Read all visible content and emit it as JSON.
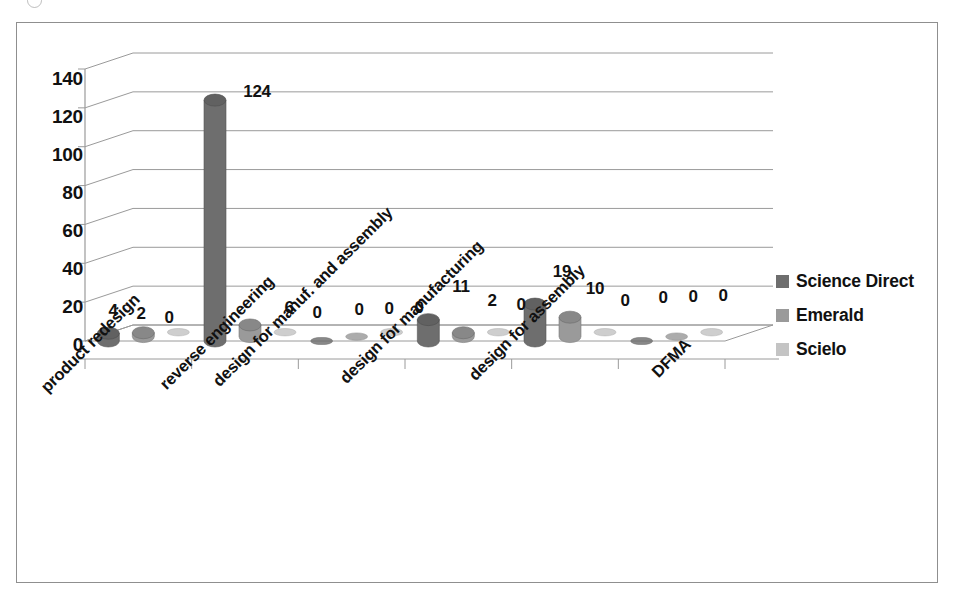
{
  "chart_data": {
    "type": "bar",
    "subtype": "3d-clustered-cylinder",
    "title": "",
    "xlabel": "",
    "ylabel": "",
    "ylim": [
      0,
      140
    ],
    "ytick_step": 20,
    "yticks": [
      "0",
      "20",
      "40",
      "60",
      "80",
      "100",
      "120",
      "140"
    ],
    "grid": true,
    "legend_position": "right",
    "data_labels": true,
    "categories": [
      "product redesign",
      "reverse engineering",
      "design for manuf. and assembly",
      "design for manufacturing",
      "design for assembly",
      "DFMA"
    ],
    "series": [
      {
        "name": "Science Direct",
        "color": "#6e6e6e",
        "values": [
          4,
          124,
          0,
          11,
          19,
          0
        ]
      },
      {
        "name": "Emerald",
        "color": "#9a9a9a",
        "values": [
          2,
          6,
          0,
          2,
          10,
          0
        ]
      },
      {
        "name": "Scielo",
        "color": "#c4c4c4",
        "values": [
          0,
          0,
          0,
          0,
          0,
          0
        ]
      }
    ]
  },
  "legend": {
    "items": [
      {
        "label": "Science Direct",
        "color": "#6e6e6e"
      },
      {
        "label": "Emerald",
        "color": "#9a9a9a"
      },
      {
        "label": "Scielo",
        "color": "#c4c4c4"
      }
    ]
  },
  "axis": {
    "y_ticks": [
      "140",
      "120",
      "100",
      "80",
      "60",
      "40",
      "20",
      "0"
    ],
    "x_categories": [
      "product redesign",
      "reverse engineering",
      "design for manuf. and assembly",
      "design for manufacturing",
      "design for assembly",
      "DFMA"
    ]
  },
  "value_labels": {
    "group_0": [
      "4",
      "2",
      "0"
    ],
    "group_1": [
      "124",
      "6",
      "0"
    ],
    "group_2": [
      "0",
      "0",
      "0"
    ],
    "group_3": [
      "11",
      "2",
      "0"
    ],
    "group_4": [
      "19",
      "10",
      "0"
    ],
    "group_5": [
      "0",
      "0",
      "0"
    ]
  },
  "colors": {
    "series_science_direct": "#6e6e6e",
    "series_emerald": "#9a9a9a",
    "series_scielo": "#c4c4c4",
    "gridline": "#9a9a9a",
    "frame": "#8f8f8f",
    "text": "#111111"
  }
}
